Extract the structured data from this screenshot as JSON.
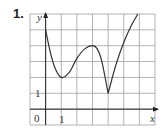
{
  "problem_number": "1.",
  "chart_data": {
    "type": "line",
    "title": "",
    "xlabel": "x",
    "ylabel": "y",
    "x_tick_labels": [
      "0",
      "1"
    ],
    "y_tick_labels": [
      "1"
    ],
    "xlim": [
      -1,
      7
    ],
    "ylim": [
      -1,
      6
    ],
    "grid": true,
    "series": [
      {
        "name": "f(x)",
        "x": [
          0,
          0.3,
          0.6,
          1,
          1.5,
          2,
          2.5,
          3,
          3.3,
          3.6,
          4,
          4.5,
          5,
          5.5,
          5.9
        ],
        "y": [
          5,
          3.6,
          2.6,
          2,
          2.3,
          3.2,
          3.8,
          4,
          3.8,
          3,
          1,
          2.8,
          4.2,
          5.3,
          6
        ]
      }
    ],
    "annotations": [
      "local min near (1,2)",
      "local max near (3,4)",
      "cusp near (4,1)"
    ]
  },
  "colors": {
    "grid": "#9a9a9a",
    "curve": "#333333",
    "axis": "#222222"
  }
}
